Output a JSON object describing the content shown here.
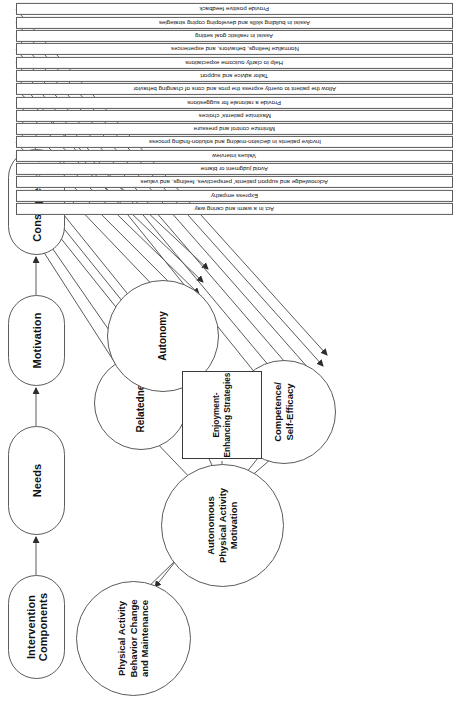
{
  "figure": {
    "title_fragment": "Conceptual Model of Physical Activity Behavior Change",
    "orientation": "rotated-90"
  },
  "stages": [
    {
      "id": "intervention-components",
      "label": "Intervention Components"
    },
    {
      "id": "needs",
      "label": "Needs"
    },
    {
      "id": "motivation",
      "label": "Motivation"
    },
    {
      "id": "consequences",
      "label": "Consequences"
    }
  ],
  "constructs": [
    {
      "id": "relatedness",
      "label": "Relatedness"
    },
    {
      "id": "autonomy",
      "label": "Autonomy"
    },
    {
      "id": "competence-self-efficacy",
      "label": "Competence/\nSelf-Efficacy"
    },
    {
      "id": "autonomous-motivation",
      "label": "Autonomous\nPhysical Activity\nMotivation"
    },
    {
      "id": "behavior-change",
      "label": "Physical Activity\nBehavior Change\nand Maintenance"
    }
  ],
  "constructs_text": {
    "relatedness": "Relatedness",
    "autonomy": "Autonomy",
    "competence": "Competence/ Self-Efficacy",
    "motivation": "Autonomous Physical Activity Motivation",
    "outcome": "Physical Activity Behavior Change and Maintenance"
  },
  "strategies_box": {
    "id": "enjoyment-enhancing-strategies",
    "label": "Enjoyment-Enhancing Strategies"
  },
  "components": [
    {
      "id": "c1",
      "label": "Act in a warm and caring way",
      "target": "relatedness"
    },
    {
      "id": "c2",
      "label": "Express empathy",
      "target": "relatedness"
    },
    {
      "id": "c3",
      "label": "Acknowledge and support patients' perspectives, feelings, and values",
      "target": "relatedness"
    },
    {
      "id": "c4",
      "label": "Avoid judgment or blame",
      "target": "relatedness"
    },
    {
      "id": "c5",
      "label": "Values interview",
      "target": "relatedness"
    },
    {
      "id": "c6",
      "label": "Involve patients in decision-making and solution-finding process",
      "target": "autonomy"
    },
    {
      "id": "c7",
      "label": "Minimize control and pressure",
      "target": "autonomy"
    },
    {
      "id": "c8",
      "label": "Maximize patients' choices",
      "target": "autonomy"
    },
    {
      "id": "c9",
      "label": "Provide a rationale for suggestions",
      "target": "autonomy"
    },
    {
      "id": "c10",
      "label": "Allow the patient to overtly express the pros and cons of changing behavior",
      "target": "autonomy"
    },
    {
      "id": "c11",
      "label": "Tailor advice and support",
      "target": "competence"
    },
    {
      "id": "c12",
      "label": "Help to clarify outcome expectations",
      "target": "competence"
    },
    {
      "id": "c13",
      "label": "Normalize feelings, behaviors, and experiences",
      "target": "competence"
    },
    {
      "id": "c14",
      "label": "Assist in realistic goal setting",
      "target": "competence"
    },
    {
      "id": "c15",
      "label": "Assist in building skills and developing coping strategies",
      "target": "competence"
    },
    {
      "id": "c16",
      "label": "Provide positive feedback",
      "target": "competence"
    }
  ],
  "colors": {
    "stroke": "#5b5b5b",
    "text": "#111111",
    "background": "#ffffff"
  }
}
